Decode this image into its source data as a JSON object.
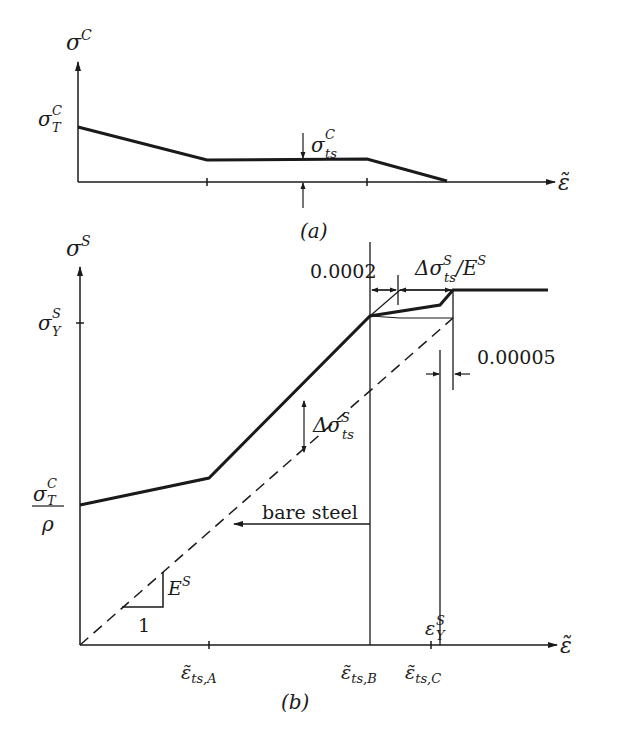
{
  "panel_a": {
    "caption": "(a)",
    "y_axis_label": "σ",
    "y_axis_sup": "C",
    "x_axis_label": "ε̃",
    "y_tick_label": {
      "base": "σ",
      "sup": "C",
      "sub": "T"
    },
    "annotation": {
      "base": "σ",
      "sup": "C",
      "sub": "ts"
    },
    "curve_points": [
      [
        78,
        128
      ],
      [
        207,
        188
      ],
      [
        368,
        186
      ],
      [
        447,
        181
      ]
    ]
  },
  "panel_b": {
    "caption": "(b)",
    "y_axis_label": "σ",
    "y_axis_sup": "S",
    "x_axis_label": "ε̃",
    "y_tick_top": {
      "base": "σ",
      "sup": "S",
      "sub": "Y"
    },
    "y_tick_bottom": {
      "num_base": "σ",
      "num_sup": "C",
      "num_sub": "T",
      "den": "ρ"
    },
    "x_ticks": [
      {
        "base": "ε̃",
        "sub": "ts,A"
      },
      {
        "base": "ε̃",
        "sub": "ts,B"
      },
      {
        "base": "ε̃",
        "sub": "ts,C"
      }
    ],
    "yield_strain": {
      "base": "ε",
      "sup": "S",
      "sub": "Y"
    },
    "dim_0002": "0.0002",
    "dim_delta": {
      "pre": "Δσ",
      "sup": "S",
      "sub": "ts",
      "post": "/E",
      "post_sup": "S"
    },
    "dim_00005": "0.00005",
    "delta_sigma": {
      "pre": "Δσ",
      "sup": "S",
      "sub": "ts"
    },
    "bare_steel_label": "bare steel",
    "slope_label": {
      "base": "E",
      "sup": "S"
    },
    "slope_run": "1"
  }
}
